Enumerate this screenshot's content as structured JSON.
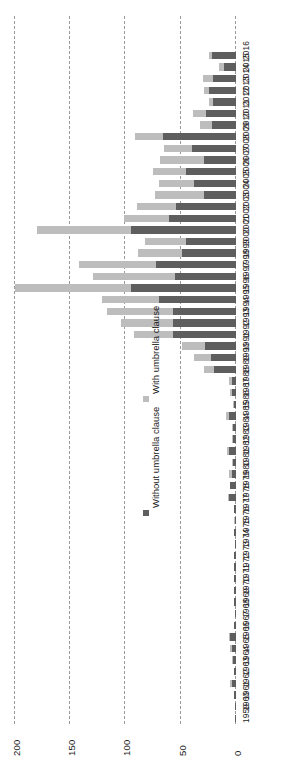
{
  "chart_data": {
    "type": "bar",
    "orientation": "horizontal-stacked",
    "title": "",
    "subtitle": "",
    "xlabel": "",
    "ylabel": "",
    "xlim": [
      0,
      210
    ],
    "grid": true,
    "grid_axis": "x",
    "xticks": [
      0,
      50,
      100,
      150,
      200
    ],
    "xtick_labels": [
      "0",
      "50",
      "100",
      "150",
      "200"
    ],
    "legend_position": "inside-middle",
    "colors": {
      "without_umbrella_clause": "#5e5e5e",
      "with_umbrella_clause": "#bdbdbd",
      "gridline": "#9a9a9a",
      "text": "#1a1a1a",
      "background": "#ffffff"
    },
    "legend": [
      {
        "label": "Without umbrella clause",
        "color": "#5e5e5e"
      },
      {
        "label": "With umbrella clause",
        "color": "#bdbdbd"
      }
    ],
    "categories": [
      "1959",
      "1960",
      "1961",
      "1962",
      "1963",
      "1964",
      "1965",
      "1966",
      "1967",
      "1968",
      "1969",
      "1970",
      "1971",
      "1972",
      "1973",
      "1974",
      "1975",
      "1976",
      "1977",
      "1978",
      "1979",
      "1980",
      "1981",
      "1982",
      "1983",
      "1984",
      "1985",
      "1986",
      "1987",
      "1988",
      "1989",
      "1990",
      "1991",
      "1992",
      "1993",
      "1994",
      "1995",
      "1996",
      "1997",
      "1998",
      "1999",
      "2000",
      "2001",
      "2002",
      "2003",
      "2004",
      "2005",
      "2006",
      "2007",
      "2008",
      "2009",
      "2010",
      "2011",
      "2012",
      "2013",
      "2014",
      "2015",
      "2016"
    ],
    "series": [
      {
        "name": "Without umbrella clause",
        "values": [
          1,
          1,
          2,
          4,
          2,
          3,
          4,
          5,
          2,
          1,
          2,
          2,
          2,
          2,
          2,
          1,
          2,
          1,
          2,
          6,
          5,
          4,
          3,
          6,
          3,
          3,
          6,
          2,
          4,
          4,
          20,
          23,
          28,
          57,
          57,
          57,
          70,
          95,
          55,
          72,
          49,
          45,
          95,
          61,
          54,
          29,
          38,
          45,
          29,
          40,
          66,
          22,
          27,
          21,
          24,
          21,
          11,
          22
        ]
      },
      {
        "name": "With umbrella clause",
        "values": [
          0,
          0,
          0,
          1,
          0,
          1,
          1,
          1,
          0,
          0,
          0,
          0,
          0,
          0,
          0,
          0,
          0,
          1,
          0,
          1,
          0,
          2,
          1,
          2,
          1,
          1,
          3,
          1,
          1,
          2,
          9,
          15,
          21,
          35,
          47,
          60,
          51,
          105,
          74,
          70,
          40,
          37,
          85,
          40,
          36,
          44,
          32,
          30,
          40,
          25,
          25,
          11,
          12,
          3,
          5,
          9,
          4,
          2
        ]
      }
    ]
  }
}
